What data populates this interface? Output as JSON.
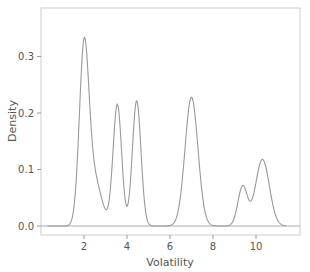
{
  "chart_data": {
    "type": "line",
    "subtype": "kde",
    "title": "",
    "xlabel": "Volatility",
    "ylabel": "Density",
    "xlim": [
      0,
      12.3
    ],
    "ylim": [
      -0.016,
      0.385
    ],
    "xticks": [
      2,
      4,
      6,
      8,
      10
    ],
    "xtick_labels": [
      "2",
      "4",
      "6",
      "8",
      "10"
    ],
    "yticks": [
      0.0,
      0.1,
      0.2,
      0.3
    ],
    "ytick_labels": [
      "0.0",
      "0.1",
      "0.2",
      "0.3"
    ],
    "grid": false,
    "legend": null,
    "line_color": "#999999",
    "peaks": [
      {
        "x": 2.0,
        "y": 0.37
      },
      {
        "x": 3.55,
        "y": 0.243
      },
      {
        "x": 4.45,
        "y": 0.246
      },
      {
        "x": 7.0,
        "y": 0.228
      },
      {
        "x": 9.4,
        "y": 0.087
      },
      {
        "x": 10.3,
        "y": 0.122
      }
    ],
    "valleys": [
      {
        "x": 3.0,
        "y": 0.071
      },
      {
        "x": 4.0,
        "y": 0.108
      },
      {
        "x": 5.6,
        "y": 0.0
      },
      {
        "x": 8.3,
        "y": 0.0
      },
      {
        "x": 9.72,
        "y": 0.064
      }
    ],
    "support": [
      0.3,
      11.4
    ],
    "components": [
      {
        "mu": 2.0,
        "sigma": 0.22,
        "w": 0.295
      },
      {
        "mu": 2.45,
        "sigma": 0.35,
        "w": 0.085
      },
      {
        "mu": 3.55,
        "sigma": 0.2,
        "w": 0.215
      },
      {
        "mu": 4.45,
        "sigma": 0.2,
        "w": 0.222
      },
      {
        "mu": 7.0,
        "sigma": 0.3,
        "w": 0.228
      },
      {
        "mu": 9.38,
        "sigma": 0.22,
        "w": 0.07
      },
      {
        "mu": 10.3,
        "sigma": 0.32,
        "w": 0.118
      }
    ]
  },
  "axes": {
    "xlabel": "Volatility",
    "ylabel": "Density"
  }
}
